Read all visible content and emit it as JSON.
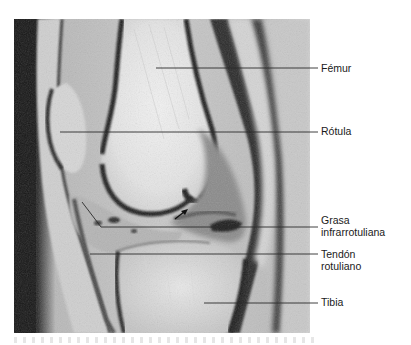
{
  "figure": {
    "type": "sagittal knee MRI with anatomical labels",
    "labels": [
      {
        "id": "femur",
        "lines": [
          "Fémur"
        ]
      },
      {
        "id": "rotula",
        "lines": [
          "Rótula"
        ]
      },
      {
        "id": "grasa",
        "lines": [
          "Grasa",
          "infrarrotuliana"
        ]
      },
      {
        "id": "tendon",
        "lines": [
          "Tendón",
          "rotuliano"
        ]
      },
      {
        "id": "tibia",
        "lines": [
          "Tibia"
        ]
      }
    ],
    "arrow": {
      "description": "black arrow pointing to infrapatellar fat region"
    },
    "colors": {
      "background": "#ffffff",
      "text": "#1a1a1a",
      "leader_line": "#2a2a2a"
    }
  }
}
